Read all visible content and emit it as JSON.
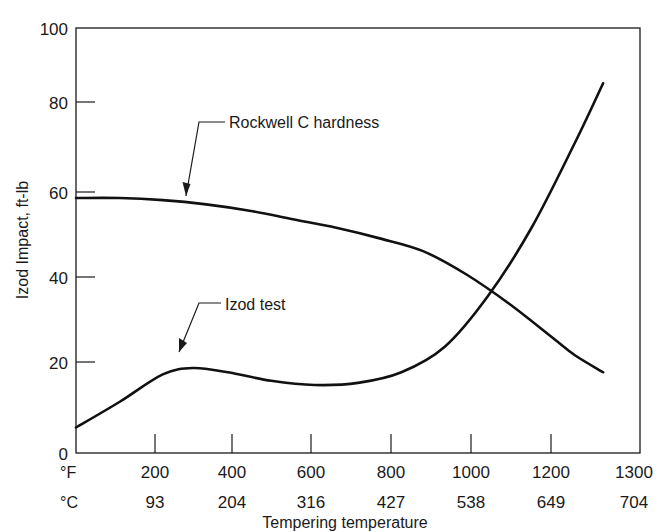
{
  "chart_data": {
    "type": "line",
    "title": "",
    "xlabel": "Tempering temperature",
    "ylabel": "Izod Impact, ft-lb",
    "x_unit_primary": "°F",
    "x_unit_secondary": "°C",
    "xlim": [
      0,
      1300
    ],
    "ylim": [
      0,
      100
    ],
    "grid": false,
    "legend_position": "inline-annotations",
    "x_ticks_f": [
      200,
      400,
      600,
      800,
      1000,
      1200,
      1300
    ],
    "x_ticks_c": [
      93,
      204,
      316,
      427,
      538,
      649,
      704
    ],
    "x_tick_labels_f": [
      "200",
      "400",
      "600",
      "800",
      "1000",
      "1200",
      "1300"
    ],
    "x_tick_labels_c": [
      "93",
      "204",
      "316",
      "427",
      "538",
      "649",
      "704"
    ],
    "y_ticks": [
      0,
      20,
      40,
      60,
      80,
      100
    ],
    "y_tick_labels": [
      "0",
      "20",
      "40",
      "60",
      "80",
      "100"
    ],
    "series": [
      {
        "name": "Rockwell C hardness",
        "annotation": "Rockwell C hardness",
        "x": [
          0,
          100,
          200,
          300,
          400,
          500,
          600,
          700,
          800,
          900,
          1000,
          1100,
          1150,
          1215
        ],
        "values": [
          60,
          60,
          59.5,
          58.5,
          57,
          55,
          53,
          50.5,
          47.5,
          42,
          35,
          27,
          23,
          19
        ]
      },
      {
        "name": "Izod test",
        "annotation": "Izod test",
        "x": [
          0,
          100,
          200,
          270,
          350,
          450,
          550,
          650,
          750,
          850,
          950,
          1050,
          1150,
          1215
        ],
        "values": [
          6,
          12,
          18.5,
          20,
          19,
          17,
          16,
          16.5,
          19,
          25,
          37,
          53,
          73,
          87
        ]
      }
    ],
    "annotations": [
      {
        "text": "Rockwell C hardness",
        "text_x_px": 229,
        "text_y_px": 125,
        "arrow_tip_x_px": 186,
        "arrow_tip_y_px": 196
      },
      {
        "text": "Izod test",
        "text_x_px": 225,
        "text_y_px": 307,
        "arrow_tip_x_px": 179,
        "arrow_tip_y_px": 352
      }
    ]
  },
  "colors": {
    "curve": "#111111",
    "axis": "#1a1a1a",
    "background": "#ffffff"
  }
}
